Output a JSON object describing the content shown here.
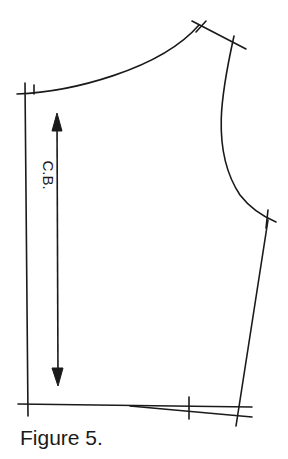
{
  "figure": {
    "caption": "Figure 5.",
    "grainline_label": "C.B.",
    "line_color": "#1a1a1a",
    "background": "#ffffff"
  },
  "pattern_piece": {
    "description": "Bodice back pattern draft",
    "points": {
      "center_back_neck": [
        25,
        94
      ],
      "side_neck": [
        199,
        25
      ],
      "shoulder_tip": [
        234,
        43
      ],
      "underarm": [
        268,
        219
      ],
      "side_waist": [
        239,
        410
      ],
      "center_back_waist": [
        27,
        403
      ]
    }
  }
}
